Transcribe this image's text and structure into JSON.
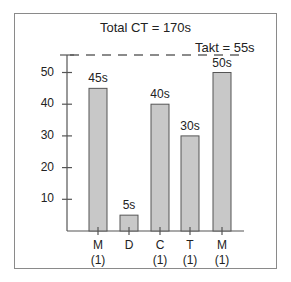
{
  "chart_data": {
    "type": "bar",
    "title": "Total CT = 170s",
    "categories": [
      "M (1)",
      "D",
      "C (1)",
      "T (1)",
      "M (1)"
    ],
    "category_lines": [
      [
        "M",
        "(1)"
      ],
      [
        "D",
        ""
      ],
      [
        "C",
        "(1)"
      ],
      [
        "T",
        "(1)"
      ],
      [
        "M",
        "(1)"
      ]
    ],
    "values": [
      45,
      5,
      40,
      30,
      50
    ],
    "value_labels": [
      "45s",
      "5s",
      "40s",
      "30s",
      "50s"
    ],
    "xlabel": "",
    "ylabel": "",
    "ylim": [
      0,
      57
    ],
    "yticks": [
      10,
      20,
      30,
      40,
      50
    ],
    "ytick_labels": [
      "10",
      "20",
      "30",
      "40",
      "50"
    ],
    "reference_line": {
      "value": 55,
      "label": "Takt = 55s",
      "style": "dashed"
    },
    "grid": false,
    "legend": null,
    "bar_color": "#c8c8c8",
    "bar_edge_color": "#555555"
  }
}
